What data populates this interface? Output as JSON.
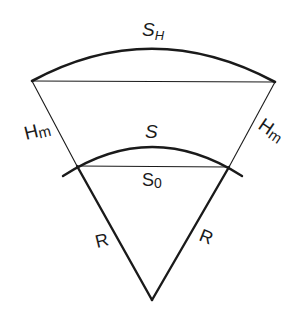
{
  "diagram": {
    "title": "",
    "stroke_color": "#1a1a1a",
    "labels": {
      "outer_arc": {
        "main": "S",
        "sub": "H"
      },
      "inner_arc": "S",
      "inner_chord": {
        "main": "S",
        "sub": "0"
      },
      "height_left": {
        "main": "H",
        "sub": "m"
      },
      "height_right": {
        "main": "H",
        "sub": "m"
      },
      "radius_left": "R",
      "radius_right": "R"
    },
    "elements": [
      "outer arc S_H",
      "outer chord",
      "inner arc S",
      "inner chord S_0",
      "left radial line (H_m segment + R segment)",
      "right radial line (H_m segment + R segment)"
    ]
  }
}
